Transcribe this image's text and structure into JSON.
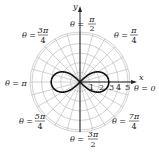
{
  "chart_data": {
    "type": "line",
    "subtype": "polar",
    "title": "",
    "curve": "lemniscate r^2 = 9 cos(2θ)",
    "series": [
      {
        "name": "lemniscate",
        "equation": "r^2 = 9cos(2theta)",
        "max_r": 3,
        "points_theta_r": [
          [
            0,
            3
          ],
          [
            0.2618,
            2.79
          ],
          [
            0.5236,
            2.12
          ],
          [
            0.7854,
            0
          ],
          [
            2.3562,
            0
          ],
          [
            2.618,
            2.12
          ],
          [
            2.8798,
            2.79
          ],
          [
            3.1416,
            3
          ]
        ]
      }
    ],
    "radial_ticks": [
      1,
      2,
      3,
      4,
      5
    ],
    "angle_labels": [
      {
        "theta": "0",
        "label": "θ = 0",
        "pos": "right"
      },
      {
        "theta": "π/4",
        "label": "θ = π/4",
        "num": "π",
        "den": "4"
      },
      {
        "theta": "π/2",
        "label": "θ = π/2",
        "num": "π",
        "den": "2"
      },
      {
        "theta": "3π/4",
        "label": "θ = 3π/4",
        "num": "3π",
        "den": "4"
      },
      {
        "theta": "π",
        "label": "θ = π"
      },
      {
        "theta": "5π/4",
        "label": "θ = 5π/4",
        "num": "5π",
        "den": "4"
      },
      {
        "theta": "3π/2",
        "label": "θ = 3π/2",
        "num": "3π",
        "den": "2"
      },
      {
        "theta": "7π/4",
        "label": "θ = 7π/4",
        "num": "7π",
        "den": "4"
      }
    ],
    "xlabel": "x",
    "ylabel": "y",
    "grid": true,
    "radial_gridline_step_deg": 15,
    "rlim": [
      0,
      5.2
    ]
  },
  "labels": {
    "x_axis": "x",
    "y_axis": "y",
    "theta_eq": "θ =",
    "t0": "θ = 0",
    "tpi": "θ = π",
    "pi4_num": "π",
    "pi4_den": "4",
    "pi2_num": "π",
    "pi2_den": "2",
    "p3pi4_num": "3π",
    "p3pi4_den": "4",
    "p5pi4_num": "5π",
    "p5pi4_den": "4",
    "p3pi2_num": "3π",
    "p3pi2_den": "2",
    "p7pi4_num": "7π",
    "p7pi4_den": "4",
    "tick1": "1",
    "tick2": "2",
    "tick3": "3",
    "tick4": "4",
    "tick5": "5"
  },
  "colors": {
    "grid": "#bdbdbd",
    "curve": "#111111",
    "axis": "#222222"
  }
}
